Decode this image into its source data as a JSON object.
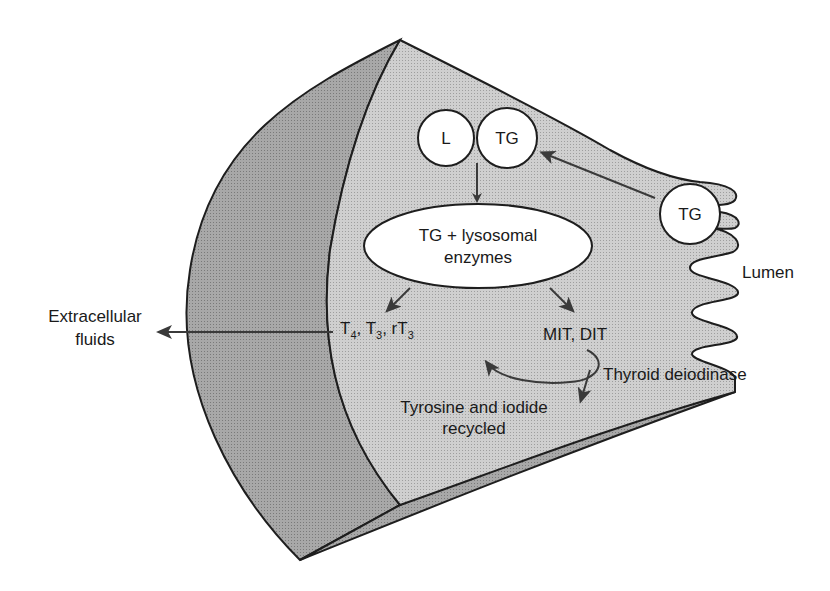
{
  "figure": {
    "type": "thyroid follicular cell schematic",
    "labels": {
      "lysosome": "L",
      "tg_vesicle": "TG",
      "lumen_tg": "TG",
      "ellipse_line1": "TG + lysosomal",
      "ellipse_line2": "enzymes",
      "hormones_T": "T",
      "hormones_sub4": "4",
      "hormones_sep1": ", T",
      "hormones_sub3a": "3",
      "hormones_sep2": ", rT",
      "hormones_sub3b": "3",
      "mit_dit": "MIT, DIT",
      "extracellular_line1": "Extracellular",
      "extracellular_line2": "fluids",
      "lumen": "Lumen",
      "deiodinase": "Thyroid deiodinase",
      "recycled_line1": "Tyrosine and iodide",
      "recycled_line2": "recycled"
    },
    "colors": {
      "cell_fill": "#c8c8c8",
      "outer_band_fill": "#a9a9a9",
      "underside_fill": "#8f8f8f",
      "stroke": "#1e1e1e",
      "vesicle_fill": "#ffffff",
      "arrow": "#3a3a3a"
    }
  }
}
